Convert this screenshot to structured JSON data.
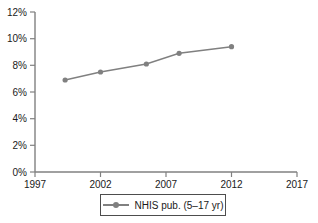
{
  "chart_data": {
    "type": "line",
    "title": "",
    "xlabel": "",
    "ylabel": "",
    "xlim": [
      1997,
      2017
    ],
    "ylim": [
      0,
      12
    ],
    "xticks": [
      "1997",
      "2002",
      "2007",
      "2012",
      "2017"
    ],
    "xtick_values": [
      1997,
      2002,
      2007,
      2012,
      2017
    ],
    "yticks": [
      "0%",
      "2%",
      "4%",
      "6%",
      "8%",
      "10%",
      "12%"
    ],
    "ytick_values": [
      0,
      2,
      4,
      6,
      8,
      10,
      12
    ],
    "grid": false,
    "legend_position": "bottom",
    "series": [
      {
        "name": "NHIS pub. (5–17 yr)",
        "color": "#808080",
        "marker": "circle",
        "x": [
          1999.3,
          2002.0,
          2005.5,
          2008.0,
          2012.0
        ],
        "values": [
          6.9,
          7.5,
          8.1,
          8.9,
          9.4
        ]
      }
    ]
  },
  "legend": {
    "items": [
      {
        "label": "NHIS pub. (5–17 yr)",
        "color": "#808080"
      }
    ]
  },
  "colors": {
    "series": "#808080",
    "axis": "#808080",
    "text": "#1a1a1a",
    "background": "#ffffff"
  }
}
